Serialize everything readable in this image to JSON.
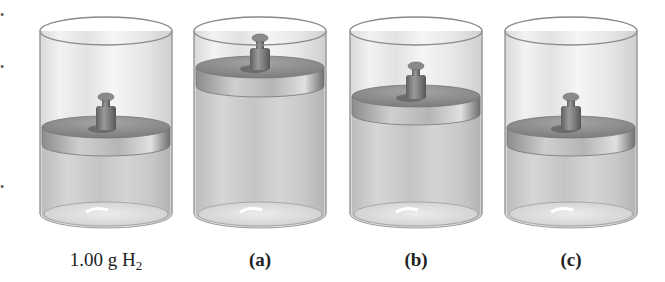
{
  "figure": {
    "colors": {
      "background": "#ffffff",
      "glass_outline": "#8a8a8a",
      "gas_fill": "#c8c8c8",
      "piston_top": "#8e8e8e",
      "piston_side": "#b0b0b0",
      "weight": "#7a7a7a"
    },
    "cylinders": [
      {
        "id": "reference",
        "label": "1.00 g H",
        "label_sub": "2",
        "label_bold": false,
        "center_x": 106,
        "piston_top_y": 127,
        "weight": true
      },
      {
        "id": "a",
        "label": "(a)",
        "label_sub": "",
        "label_bold": true,
        "center_x": 260,
        "piston_top_y": 67,
        "weight": true
      },
      {
        "id": "b",
        "label": "(b)",
        "label_sub": "",
        "label_bold": true,
        "center_x": 416,
        "piston_top_y": 96,
        "weight": true
      },
      {
        "id": "c",
        "label": "(c)",
        "label_sub": "",
        "label_bold": true,
        "center_x": 571,
        "piston_top_y": 127,
        "weight": true
      }
    ]
  },
  "labels": {
    "reference_main": "1.00 g H",
    "reference_sub": "2",
    "a": "(a)",
    "b": "(b)",
    "c": "(c)"
  }
}
